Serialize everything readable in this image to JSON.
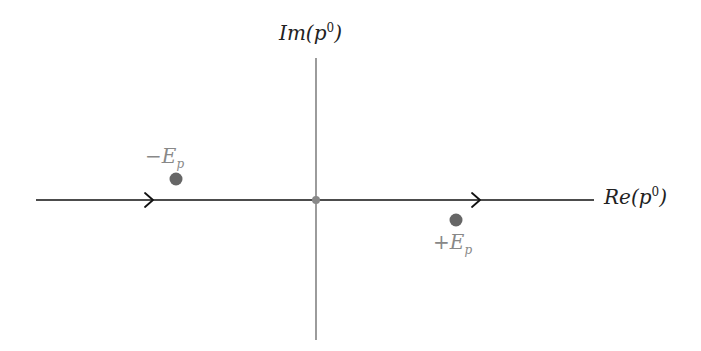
{
  "diagram": {
    "axes": {
      "imaginary_label": {
        "base": "Im(p",
        "sup": "0",
        "close": ")"
      },
      "real_label": {
        "base": "Re(p",
        "sup": "0",
        "close": ")"
      }
    },
    "origin": {
      "x": 316,
      "y": 200
    },
    "poles": [
      {
        "id": "neg",
        "sign": "−",
        "symbol": "E",
        "sub": "p",
        "x": 176,
        "y": 179,
        "note": "above real axis"
      },
      {
        "id": "pos",
        "sign": "+",
        "symbol": "E",
        "sub": "p",
        "x": 456,
        "y": 220,
        "note": "below real axis"
      }
    ],
    "contour": {
      "description": "along real axis, left to right",
      "arrows": [
        {
          "x": 150
        },
        {
          "x": 478
        }
      ]
    },
    "colors": {
      "axis": "#666666",
      "contour": "#111111",
      "pole": "#666666",
      "pole_label": "#888888",
      "axis_label": "#222222"
    }
  }
}
